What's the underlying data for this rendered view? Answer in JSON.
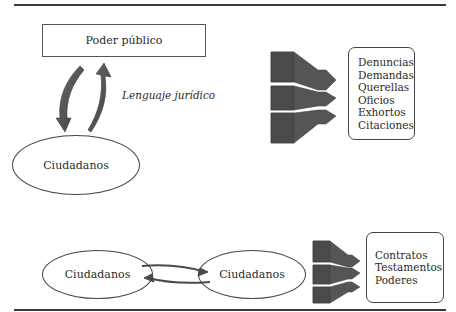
{
  "diagram": {
    "top_section": {
      "authority_box": {
        "label": "Poder público"
      },
      "relation_label": "Lenguaje jurídico",
      "citizens_ellipse": {
        "label": "Ciudadanos"
      },
      "document_list": {
        "items": [
          "Denuncias",
          "Demandas",
          "Querellas",
          "Oficios",
          "Exhortos",
          "Citaciones"
        ]
      }
    },
    "bottom_section": {
      "citizens_left": {
        "label": "Ciudadanos"
      },
      "citizens_right": {
        "label": "Ciudadanos"
      },
      "document_list": {
        "items": [
          "Contratos",
          "Testamentos",
          "Poderes"
        ]
      }
    },
    "colors": {
      "line": "#3a3a3a",
      "arrow_fill": "#5a5a5a",
      "arrow_dark": "#444444",
      "text": "#2a2a2a"
    }
  }
}
